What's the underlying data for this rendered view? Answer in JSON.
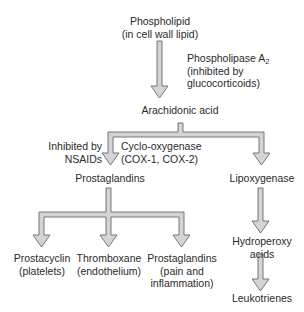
{
  "diagram": {
    "type": "flowchart",
    "nodes": {
      "phospholipid": {
        "line1": "Phospholipid",
        "line2": "(in cell wall lipid)"
      },
      "arachidonic_acid": {
        "label": "Arachidonic acid"
      },
      "prostaglandins_mid": {
        "label": "Prostaglandins"
      },
      "lipoxygenase": {
        "label": "Lipoxygenase"
      },
      "hydroperoxy_acids": {
        "line1": "Hydroperoxy",
        "line2": "acids"
      },
      "leukotrienes": {
        "label": "Leukotrienes"
      },
      "prostacyclin": {
        "line1": "Prostacyclin",
        "line2": "(platelets)"
      },
      "thromboxane": {
        "line1": "Thromboxane",
        "line2": "(endothelium)"
      },
      "prostaglandins_pain": {
        "line1": "Prostaglandins",
        "line2": "(pain and",
        "line3": "inflammation)"
      }
    },
    "edge_labels": {
      "phospholipase": {
        "line1_main": "Phospholipase A",
        "line1_sub": "2",
        "line2": "(inhibited by",
        "line3": "glucocorticoids)"
      },
      "nsaids": {
        "line1": "Inhibited by",
        "line2": "NSAIDs"
      },
      "cox": {
        "line1": "Cyclo-oxygenase",
        "line2": "(COX-1,  COX-2)"
      }
    },
    "edges": [
      {
        "from": "Phospholipid",
        "to": "Arachidonic acid",
        "label": "Phospholipase A2 (inhibited by glucocorticoids)"
      },
      {
        "from": "Arachidonic acid",
        "to": "Prostaglandins",
        "label": "Cyclo-oxygenase (COX-1, COX-2); Inhibited by NSAIDs"
      },
      {
        "from": "Arachidonic acid",
        "to": "Lipoxygenase"
      },
      {
        "from": "Lipoxygenase",
        "to": "Hydroperoxy acids"
      },
      {
        "from": "Hydroperoxy acids",
        "to": "Leukotrienes"
      },
      {
        "from": "Prostaglandins",
        "to": "Prostacyclin (platelets)"
      },
      {
        "from": "Prostaglandins",
        "to": "Thromboxane (endothelium)"
      },
      {
        "from": "Prostaglandins",
        "to": "Prostaglandins (pain and inflammation)"
      }
    ],
    "colors": {
      "arrow_fill": "#d4d4d4",
      "arrow_stroke": "#6a6a6a",
      "text": "#2a2a2a",
      "background": "#ffffff"
    }
  }
}
